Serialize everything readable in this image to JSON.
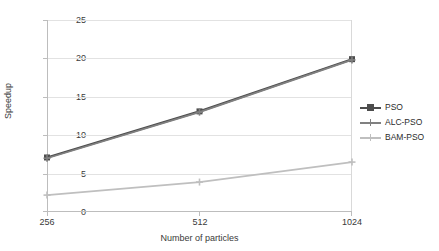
{
  "chart_data": {
    "type": "line",
    "title": "",
    "xlabel": "Number of particles",
    "ylabel": "Speedup",
    "categories": [
      "256",
      "512",
      "1024"
    ],
    "x": [
      256,
      512,
      1024
    ],
    "xlim": [
      256,
      1024
    ],
    "ylim": [
      0,
      25
    ],
    "yticks": [
      0,
      5,
      10,
      15,
      20,
      25
    ],
    "ytick_labels": [
      "0",
      "5",
      "10",
      "15",
      "20",
      "25"
    ],
    "xtick_labels": [
      "256",
      "512",
      "1024"
    ],
    "grid": true,
    "legend_position": "right",
    "series": [
      {
        "name": "PSO",
        "values": [
          7.1,
          13.1,
          19.9
        ],
        "color": "#4d4d4d",
        "marker": "square"
      },
      {
        "name": "ALC-PSO",
        "values": [
          7.0,
          13.0,
          19.8
        ],
        "color": "#808080",
        "marker": "plus"
      },
      {
        "name": "BAM-PSO",
        "values": [
          2.2,
          3.9,
          6.5
        ],
        "color": "#bfbfbf",
        "marker": "plus"
      }
    ]
  },
  "legend": {
    "items": [
      {
        "label": "PSO",
        "color": "#4d4d4d"
      },
      {
        "label": "ALC-PSO",
        "color": "#808080"
      },
      {
        "label": "BAM-PSO",
        "color": "#bfbfbf"
      }
    ]
  },
  "axes": {
    "y_title": "Speedup",
    "x_title": "Number of particles",
    "y_ticks": [
      "25",
      "20",
      "15",
      "10",
      "5",
      "0"
    ],
    "x_ticks": [
      "256",
      "512",
      "1024"
    ]
  }
}
